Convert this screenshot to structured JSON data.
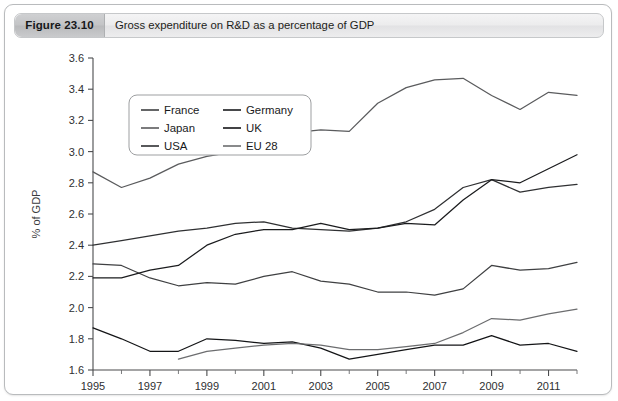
{
  "header": {
    "figure_label": "Figure 23.10",
    "title": "Gross expenditure on R&D as a percentage of GDP"
  },
  "chart_data": {
    "type": "line",
    "title": "Gross expenditure on R&D as a percentage of GDP",
    "xlabel": "",
    "ylabel": "% of GDP",
    "xlim": [
      1995,
      2012
    ],
    "ylim": [
      1.6,
      3.6
    ],
    "ytick_labels": [
      "1.6",
      "1.8",
      "2.0",
      "2.2",
      "2.4",
      "2.6",
      "2.8",
      "3.0",
      "3.2",
      "3.4",
      "3.6"
    ],
    "yticks": [
      1.6,
      1.8,
      2.0,
      2.2,
      2.4,
      2.6,
      2.8,
      3.0,
      3.2,
      3.4,
      3.6
    ],
    "xtick_labels": [
      "1995",
      "1997",
      "1999",
      "2001",
      "2003",
      "2005",
      "2007",
      "2009",
      "2011"
    ],
    "xticks": [
      1995,
      1997,
      1999,
      2001,
      2003,
      2005,
      2007,
      2009,
      2011
    ],
    "xticks_minor": [
      1996,
      1998,
      2000,
      2002,
      2004,
      2006,
      2008,
      2010,
      2012
    ],
    "grid": false,
    "legend_position": "upper-left-inside",
    "x": [
      1995,
      1996,
      1997,
      1998,
      1999,
      2000,
      2001,
      2002,
      2003,
      2004,
      2005,
      2006,
      2007,
      2008,
      2009,
      2010,
      2011,
      2012
    ],
    "series": [
      {
        "name": "France",
        "color": "#3f4042",
        "x": [
          1995,
          1996,
          1997,
          1998,
          1999,
          2000,
          2001,
          2002,
          2003,
          2004,
          2005,
          2006,
          2007,
          2008,
          2009,
          2010,
          2011,
          2012
        ],
        "values": [
          2.28,
          2.27,
          2.19,
          2.14,
          2.16,
          2.15,
          2.2,
          2.23,
          2.17,
          2.15,
          2.1,
          2.1,
          2.08,
          2.12,
          2.27,
          2.24,
          2.25,
          2.29
        ]
      },
      {
        "name": "Japan",
        "color": "#5a5b5d",
        "x": [
          1995,
          1996,
          1997,
          1998,
          1999,
          2000,
          2001,
          2002,
          2003,
          2004,
          2005,
          2006,
          2007,
          2008,
          2009,
          2010,
          2011,
          2012
        ],
        "values": [
          2.87,
          2.77,
          2.83,
          2.92,
          2.97,
          3.0,
          3.07,
          3.12,
          3.14,
          3.13,
          3.31,
          3.41,
          3.46,
          3.47,
          3.36,
          3.27,
          3.38,
          3.36
        ]
      },
      {
        "name": "USA",
        "color": "#2f3032",
        "x": [
          1995,
          1996,
          1997,
          1998,
          1999,
          2000,
          2001,
          2002,
          2003,
          2004,
          2005,
          2006,
          2007,
          2008,
          2009,
          2010,
          2011,
          2012
        ],
        "values": [
          2.4,
          2.43,
          2.46,
          2.49,
          2.51,
          2.54,
          2.55,
          2.51,
          2.5,
          2.49,
          2.51,
          2.55,
          2.63,
          2.77,
          2.82,
          2.74,
          2.77,
          2.79
        ]
      },
      {
        "name": "Germany",
        "color": "#1b1c1e",
        "x": [
          1995,
          1996,
          1997,
          1998,
          1999,
          2000,
          2001,
          2002,
          2003,
          2004,
          2005,
          2006,
          2007,
          2008,
          2009,
          2010,
          2011,
          2012
        ],
        "values": [
          2.19,
          2.19,
          2.24,
          2.27,
          2.4,
          2.47,
          2.5,
          2.5,
          2.54,
          2.5,
          2.51,
          2.54,
          2.53,
          2.69,
          2.82,
          2.8,
          2.89,
          2.98
        ]
      },
      {
        "name": "UK",
        "color": "#141517",
        "x": [
          1995,
          1996,
          1997,
          1998,
          1999,
          2000,
          2001,
          2002,
          2003,
          2004,
          2005,
          2006,
          2007,
          2008,
          2009,
          2010,
          2011,
          2012
        ],
        "values": [
          1.87,
          1.8,
          1.72,
          1.72,
          1.8,
          1.79,
          1.77,
          1.78,
          1.74,
          1.67,
          1.7,
          1.73,
          1.76,
          1.76,
          1.82,
          1.76,
          1.77,
          1.72
        ]
      },
      {
        "name": "EU 28",
        "color": "#6c6d6f",
        "x": [
          1998,
          1999,
          2000,
          2001,
          2002,
          2003,
          2004,
          2005,
          2006,
          2007,
          2008,
          2009,
          2010,
          2011,
          2012
        ],
        "values": [
          1.67,
          1.72,
          1.74,
          1.76,
          1.77,
          1.76,
          1.73,
          1.73,
          1.75,
          1.77,
          1.84,
          1.93,
          1.92,
          1.96,
          1.99
        ]
      }
    ],
    "legend_columns": [
      [
        "France",
        "Japan",
        "USA"
      ],
      [
        "Germany",
        "UK",
        "EU 28"
      ]
    ]
  }
}
